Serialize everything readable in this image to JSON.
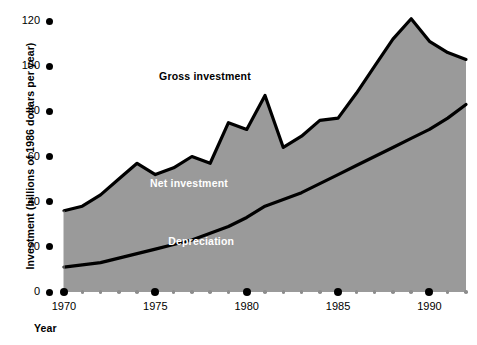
{
  "chart_data": {
    "type": "area",
    "title": "",
    "xlabel": "Year",
    "ylabel": "Investment (billions of 1986 dollars per year)",
    "xlim": [
      1970,
      1992
    ],
    "ylim": [
      0,
      120
    ],
    "ytick_labels": [
      "0",
      "20",
      "40",
      "60",
      "80",
      "100",
      "120"
    ],
    "ytick_values": [
      0,
      20,
      40,
      60,
      80,
      100,
      120
    ],
    "xtick_labels": [
      "1970",
      "1975",
      "1980",
      "1985",
      "1990"
    ],
    "xtick_values": [
      1970,
      1975,
      1980,
      1985,
      1990
    ],
    "x": [
      1970,
      1971,
      1972,
      1973,
      1974,
      1975,
      1976,
      1977,
      1978,
      1979,
      1980,
      1981,
      1982,
      1983,
      1984,
      1985,
      1986,
      1987,
      1988,
      1989,
      1990,
      1991,
      1992
    ],
    "series": [
      {
        "name": "Gross investment",
        "label_color": "#000000",
        "values": [
          36,
          38,
          43,
          50,
          57,
          52,
          55,
          60,
          57,
          75,
          72,
          87,
          64,
          69,
          76,
          77,
          88,
          100,
          112,
          121,
          111,
          106,
          103
        ]
      },
      {
        "name": "Depreciation",
        "label_color": "#ffffff",
        "values": [
          11,
          12,
          13,
          15,
          17,
          19,
          21,
          23,
          26,
          29,
          33,
          38,
          41,
          44,
          48,
          52,
          56,
          60,
          64,
          68,
          72,
          77,
          83
        ]
      }
    ],
    "band_labels": [
      {
        "name": "Gross investment",
        "x": 1977.5,
        "y": 95,
        "color": "dark"
      },
      {
        "name": "Net investment",
        "x": 1977.0,
        "y": 48,
        "color": "light"
      },
      {
        "name": "Depreciation",
        "x": 1978.0,
        "y": 22,
        "color": "light"
      }
    ],
    "colors": {
      "fill": "#9a9a9a",
      "line": "#000000",
      "background": "#ffffff",
      "minor_tick": "#8d8d8d"
    },
    "grid": false,
    "legend": "inline-band-labels"
  },
  "labels": {
    "y_axis_title": "Investment (billions of 1986 dollars per year)",
    "x_axis_title": "Year",
    "gross_investment": "Gross investment",
    "net_investment": "Net investment",
    "depreciation": "Depreciation"
  }
}
